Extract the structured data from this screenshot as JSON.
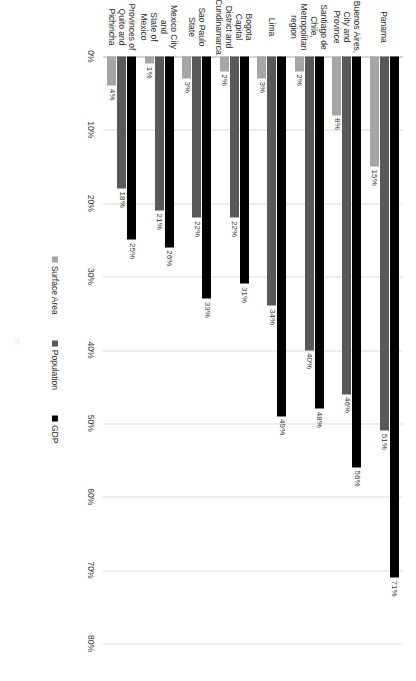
{
  "chart_data": {
    "type": "bar",
    "orientation": "horizontal",
    "title": "",
    "subtitle": "",
    "xlabel": "",
    "ylabel": "",
    "xlim": [
      0,
      80
    ],
    "xtick_labels": [
      "0%",
      "10%",
      "20%",
      "30%",
      "40%",
      "50%",
      "60%",
      "70%",
      "80%"
    ],
    "xtick_values": [
      0,
      10,
      20,
      30,
      40,
      50,
      60,
      70,
      80
    ],
    "grid": true,
    "legend_position": "bottom",
    "categories": [
      "Panama",
      "Buenos Aires, City and Province",
      "Santiago de Chile, Metropolitan region",
      "Lima",
      "Bogota Capital District and Cundinamarca",
      "Sao Paulo State",
      "Mexico City and State of Mexico",
      "Provinces of Quito and Pichincha"
    ],
    "category_lines": [
      [
        "Panama"
      ],
      [
        "Buenos Aires,",
        "City and",
        "Province"
      ],
      [
        "Santiago de",
        "Chile,",
        "Metropolitan",
        "region"
      ],
      [
        "Lima"
      ],
      [
        "Bogota Capital",
        "District and",
        "Cundinamarca"
      ],
      [
        "Sao Paulo",
        "State"
      ],
      [
        "Mexico City and",
        "State of Mexico"
      ],
      [
        "Provinces of",
        "Quito and",
        "Pichincha"
      ]
    ],
    "series": [
      {
        "name": "GDP",
        "color": "#000000",
        "values": [
          71,
          56,
          48,
          49,
          31,
          33,
          26,
          25
        ],
        "labels": [
          "71%",
          "56%",
          "48%",
          "49%",
          "31%",
          "33%",
          "26%",
          "25%"
        ]
      },
      {
        "name": "Population",
        "color": "#595959",
        "values": [
          51,
          46,
          40,
          34,
          22,
          22,
          21,
          18
        ],
        "labels": [
          "51%",
          "46%",
          "40%",
          "34%",
          "22%",
          "22%",
          "21%",
          "18%"
        ]
      },
      {
        "name": "Surface Area",
        "color": "#a6a6a6",
        "values": [
          15,
          8,
          2,
          3,
          2,
          3,
          1,
          4
        ],
        "labels": [
          "15%",
          "8%",
          "2%",
          "3%",
          "2%",
          "3%",
          "1%",
          "4%"
        ]
      }
    ]
  },
  "legend": {
    "items": [
      {
        "label": "Surface Area",
        "color": "#a6a6a6"
      },
      {
        "label": "Population",
        "color": "#595959"
      },
      {
        "label": "GDP",
        "color": "#000000"
      }
    ]
  },
  "footer": {
    "page_number": "35"
  }
}
